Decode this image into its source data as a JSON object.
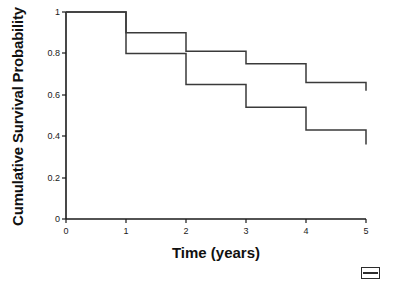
{
  "chart_data": {
    "type": "line",
    "title": "",
    "xlabel": "Time (years)",
    "ylabel": "Cumulative Survival Probability",
    "xlim": [
      0,
      5
    ],
    "ylim": [
      0,
      1
    ],
    "xticks": [
      "0",
      "1",
      "2",
      "3",
      "4",
      "5"
    ],
    "yticks": [
      "0",
      "0.2",
      "0.4",
      "0.6",
      "0.8",
      "1"
    ],
    "grid": false,
    "legend": "none",
    "step_style": "post",
    "x": [
      0,
      1,
      2,
      3,
      4,
      5
    ],
    "series": [
      {
        "name": "upper-curve",
        "values": [
          1.0,
          0.9,
          0.81,
          0.75,
          0.66,
          0.62
        ],
        "color": "#3a3a3a"
      },
      {
        "name": "lower-curve",
        "values": [
          1.0,
          0.8,
          0.65,
          0.54,
          0.43,
          0.36
        ],
        "color": "#3a3a3a"
      }
    ],
    "annotations": []
  },
  "axes": {
    "y_title": "Cumulative Survival Probability",
    "x_title": "Time (years)",
    "y_ticks": [
      {
        "value": "1",
        "pos": 12
      },
      {
        "value": "0.8",
        "pos": 53
      },
      {
        "value": "0.6",
        "pos": 95
      },
      {
        "value": "0.4",
        "pos": 136
      },
      {
        "value": "0.2",
        "pos": 178
      },
      {
        "value": "0",
        "pos": 219
      }
    ],
    "x_ticks": [
      {
        "value": "0",
        "pos": 66
      },
      {
        "value": "1",
        "pos": 126
      },
      {
        "value": "2",
        "pos": 186
      },
      {
        "value": "3",
        "pos": 246
      },
      {
        "value": "4",
        "pos": 306
      },
      {
        "value": "5",
        "pos": 366
      }
    ]
  },
  "colors": {
    "axis": "#1a1a1a",
    "curve": "#3a3a3a",
    "background": "#ffffff",
    "text": "#111111"
  }
}
